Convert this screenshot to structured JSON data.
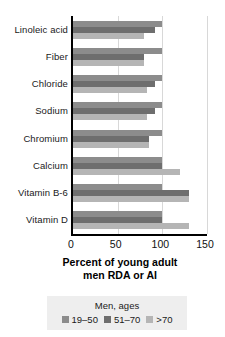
{
  "chart_data": {
    "type": "bar",
    "orientation": "horizontal",
    "title": "",
    "xlabel": "Percent of young adult men RDA or AI",
    "ylabel": "",
    "xlim": [
      0,
      150
    ],
    "xticks": [
      0,
      50,
      100,
      150
    ],
    "xtick_labels": [
      "0",
      "50",
      "100",
      "150"
    ],
    "grid": true,
    "grid_axis": "x",
    "legend_position": "bottom",
    "legend_title": "Men, ages",
    "categories": [
      "Linoleic acid",
      "Fiber",
      "Chloride",
      "Sodium",
      "Chromium",
      "Calcium",
      "Vitamin B-6",
      "Vitamin D"
    ],
    "series": [
      {
        "name": "19-50",
        "color": "#8c8c8c",
        "values": [
          100,
          100,
          100,
          100,
          100,
          100,
          100,
          100
        ]
      },
      {
        "name": "51-70",
        "color": "#6e6e6e",
        "values": [
          92,
          80,
          92,
          92,
          85,
          100,
          130,
          100
        ]
      },
      {
        "name": ">70",
        "color": "#b5b5b5",
        "values": [
          80,
          80,
          83,
          83,
          85,
          120,
          130,
          130
        ]
      }
    ]
  },
  "axis_title": {
    "line1": "Percent of young adult",
    "line2": "men RDA or AI"
  },
  "legend": {
    "title": "Men, ages",
    "items": [
      {
        "label": "19–50",
        "color": "#8c8c8c"
      },
      {
        "label": "51–70",
        "color": "#6e6e6e"
      },
      {
        "label": ">70",
        "color": "#b5b5b5"
      }
    ]
  },
  "colors": {
    "series_19_50": "#8c8c8c",
    "series_51_70": "#6e6e6e",
    "series_over_70": "#b5b5b5",
    "axis": "#000000",
    "gridline": "#d8d8d8",
    "legend_background": "#eeeeee",
    "background": "#ffffff"
  }
}
